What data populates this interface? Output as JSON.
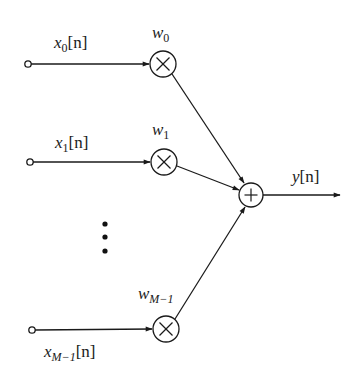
{
  "diagram": {
    "inputs": [
      {
        "var": "x",
        "sub": "0",
        "arg": "[n]",
        "weight_var": "w",
        "weight_sub": "0"
      },
      {
        "var": "x",
        "sub": "1",
        "arg": "[n]",
        "weight_var": "w",
        "weight_sub": "1"
      },
      {
        "var": "x",
        "sub": "M−1",
        "arg": "[n]",
        "weight_var": "w",
        "weight_sub": "M−1"
      }
    ],
    "ellipsis": "⋮",
    "multiplier_symbol": "multiply-circle",
    "adder_symbol": "plus-circle",
    "output": {
      "var": "y",
      "arg": "[n]"
    },
    "colors": {
      "line": "#1a1a1a",
      "background": "#ffffff"
    }
  }
}
